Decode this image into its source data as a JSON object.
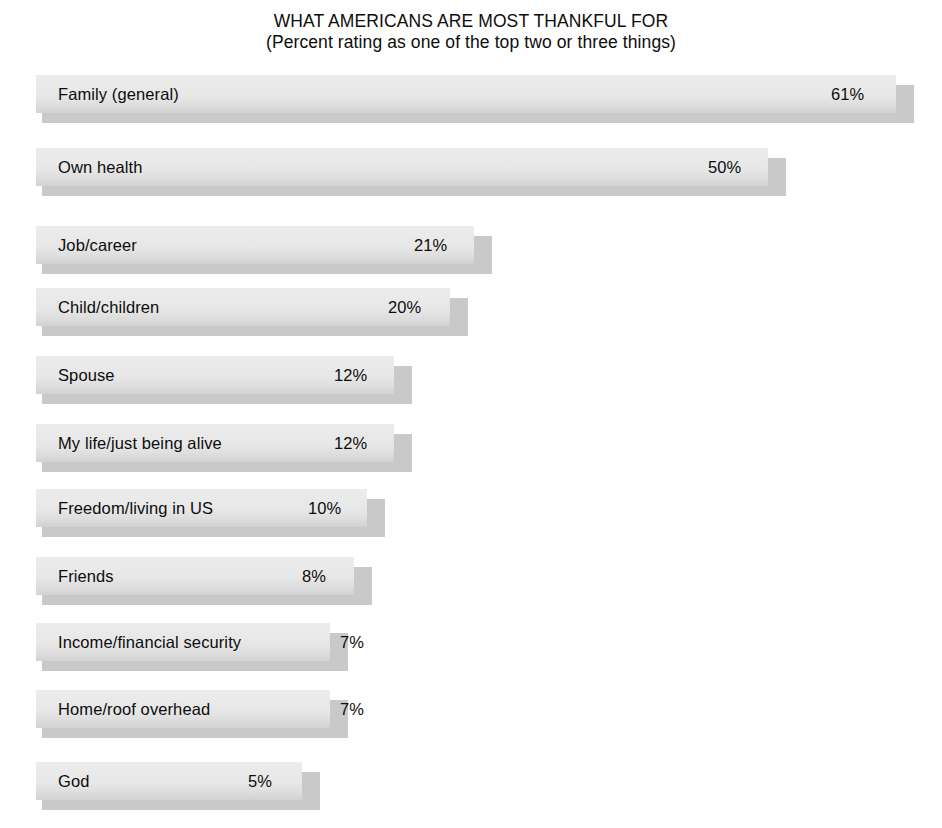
{
  "chart_data": {
    "type": "bar",
    "orientation": "horizontal",
    "title": "WHAT AMERICANS ARE MOST THANKFUL FOR",
    "subtitle": "(Percent rating as one of the top two or three things)",
    "xlabel": "",
    "ylabel": "",
    "xlim": [
      0,
      65
    ],
    "grid": false,
    "legend": null,
    "value_suffix": "%",
    "colors": {
      "bar_face": "#e6e6e6",
      "bar_shadow": "#c9c9c9",
      "text": "#0d0d0d",
      "background": "#ffffff"
    },
    "categories": [
      "Family (general)",
      "Own health",
      "Job/career",
      "Child/children",
      "Spouse",
      "My life/just being alive",
      "Freedom/living in US",
      "Friends",
      "Income/financial security",
      "Home/roof overhead",
      "God"
    ],
    "values": [
      61,
      50,
      21,
      20,
      12,
      12,
      10,
      8,
      7,
      7,
      5
    ],
    "value_labels": [
      "61%",
      "50%",
      "21%",
      "20%",
      "12%",
      "12%",
      "10%",
      "8%",
      "7%",
      "7%",
      "5%"
    ],
    "rows": [
      {
        "label": "Family (general)",
        "value": 61,
        "value_label": "61%",
        "top": 75,
        "bar_width": 860,
        "value_x": 795,
        "value_inside": true
      },
      {
        "label": "Own health",
        "value": 50,
        "value_label": "50%",
        "top": 148,
        "bar_width": 732,
        "value_x": 672,
        "value_inside": true
      },
      {
        "label": "Job/career",
        "value": 21,
        "value_label": "21%",
        "top": 226,
        "bar_width": 438,
        "value_x": 378,
        "value_inside": true
      },
      {
        "label": "Child/children",
        "value": 20,
        "value_label": "20%",
        "top": 288,
        "bar_width": 414,
        "value_x": 352,
        "value_inside": true
      },
      {
        "label": "Spouse",
        "value": 12,
        "value_label": "12%",
        "top": 356,
        "bar_width": 358,
        "value_x": 298,
        "value_inside": true
      },
      {
        "label": "My life/just being alive",
        "value": 12,
        "value_label": "12%",
        "top": 424,
        "bar_width": 358,
        "value_x": 298,
        "value_inside": true
      },
      {
        "label": "Freedom/living in US",
        "value": 10,
        "value_label": "10%",
        "top": 489,
        "bar_width": 331,
        "value_x": 272,
        "value_inside": true
      },
      {
        "label": "Friends",
        "value": 8,
        "value_label": "8%",
        "top": 557,
        "bar_width": 318,
        "value_x": 266,
        "value_inside": true
      },
      {
        "label": "Income/financial security",
        "value": 7,
        "value_label": "7%",
        "top": 623,
        "bar_width": 294,
        "value_x": 304,
        "value_inside": false
      },
      {
        "label": "Home/roof overhead",
        "value": 7,
        "value_label": "7%",
        "top": 690,
        "bar_width": 294,
        "value_x": 304,
        "value_inside": false
      },
      {
        "label": "God",
        "value": 5,
        "value_label": "5%",
        "top": 762,
        "bar_width": 266,
        "value_x": 212,
        "value_inside": true
      }
    ]
  }
}
